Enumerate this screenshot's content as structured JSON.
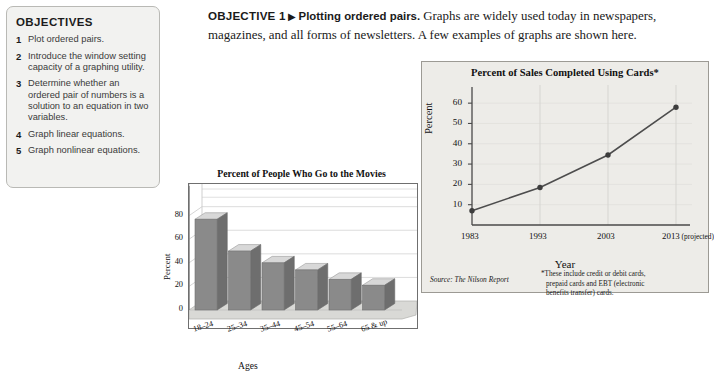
{
  "objectives": {
    "title": "OBJECTIVES",
    "items": [
      {
        "num": "1",
        "text": "Plot ordered pairs."
      },
      {
        "num": "2",
        "text": "Introduce the window setting capacity of a graphing utility."
      },
      {
        "num": "3",
        "text": "Determine whether an ordered pair of numbers is a solution to an equation in two variables."
      },
      {
        "num": "4",
        "text": "Graph linear equations."
      },
      {
        "num": "5",
        "text": "Graph nonlinear equations."
      }
    ]
  },
  "heading": {
    "objective_tag": "OBJECTIVE 1",
    "arrow": "▶",
    "objective_subtitle": "Plotting ordered pairs.",
    "body": "Graphs are widely used today in newspapers, magazines, and all forms of newsletters. A few examples of graphs are shown here."
  },
  "chart_data": [
    {
      "id": "line-chart",
      "type": "line",
      "title": "Percent of Sales Completed Using Cards*",
      "xlabel": "Year",
      "ylabel": "Percent",
      "categories": [
        "1983",
        "1993",
        "2003",
        "2013 (projected)"
      ],
      "x_tick_main": [
        "1983",
        "1993",
        "2003",
        "2013"
      ],
      "x_tick_suffix": " (projected)",
      "values": [
        7,
        18.5,
        34.5,
        58
      ],
      "yticks": [
        10,
        20,
        30,
        40,
        50,
        60
      ],
      "ylim": [
        0,
        65
      ],
      "grid": true,
      "legend": "none",
      "source": "Source: The Nilson Report",
      "footnote": [
        "*These include credit or debit cards,",
        "prepaid cards and EBT (electronic",
        "benefits transfer) cards."
      ],
      "line_color": "#4d4d4d",
      "marker_color": "#3d3d3d",
      "panel_bg": "#edece8"
    },
    {
      "id": "bar-chart",
      "type": "bar",
      "title": "Percent of People Who Go to the Movies",
      "xlabel": "Ages",
      "ylabel": "Percent",
      "categories": [
        "18–24",
        "25–34",
        "35–44",
        "45–54",
        "55–64",
        "65 & up"
      ],
      "values": [
        77,
        50,
        40,
        34,
        26,
        21
      ],
      "yticks": [
        0,
        20,
        40,
        60,
        80
      ],
      "ylim": [
        0,
        95
      ],
      "grid": true,
      "legend": "none",
      "bar_color": "#8a8a8a",
      "bar_top_color": "#d8d8d8",
      "bar_side_color": "#6e6e6e",
      "floor_color": "#d9d9d6"
    }
  ]
}
